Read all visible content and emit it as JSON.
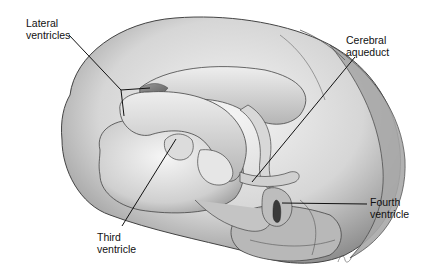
{
  "figure": {
    "labels": [
      {
        "id": "lateral",
        "text": "Lateral\nventricles",
        "x": 26,
        "y": 17
      },
      {
        "id": "aqueduct",
        "text": "Cerebral\naqueduct",
        "x": 346,
        "y": 34
      },
      {
        "id": "fourth",
        "text": "Fourth\nventricle",
        "x": 370,
        "y": 196
      },
      {
        "id": "third",
        "text": "Third\nventricle",
        "x": 97,
        "y": 231
      }
    ],
    "colors": {
      "background": "#ffffff",
      "line": "#111111"
    }
  }
}
